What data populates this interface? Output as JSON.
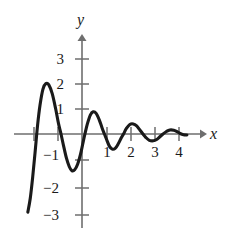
{
  "figure": {
    "title": "",
    "background_color": "#ffffff",
    "curve_color": "#1a1a1a",
    "axis_color": "#6e6e6e",
    "label_color": "#1a1a1a"
  },
  "axes": {
    "x_axis_label": "x",
    "y_axis_label": "y",
    "x_ticks": [
      {
        "value": -2,
        "label": ""
      },
      {
        "value": -1,
        "label": "−1"
      },
      {
        "value": 1,
        "label": "1"
      },
      {
        "value": 2,
        "label": "2"
      },
      {
        "value": 3,
        "label": "3"
      },
      {
        "value": 4,
        "label": "4"
      }
    ],
    "y_ticks": [
      {
        "value": 3,
        "label": "3"
      },
      {
        "value": 2,
        "label": "2"
      },
      {
        "value": 1,
        "label": "1"
      },
      {
        "value": -1,
        "label": "−1"
      },
      {
        "value": -2,
        "label": "−2"
      },
      {
        "value": -3,
        "label": "−3"
      }
    ],
    "x_arrow": "right",
    "y_arrow": "up"
  },
  "chart_data": {
    "type": "line",
    "title": "",
    "xlabel": "x",
    "ylabel": "y",
    "xlim": [
      -2.3,
      4.6
    ],
    "ylim": [
      -3.4,
      3.4
    ],
    "grid": false,
    "legend": "none",
    "x_ticks": [
      -2,
      -1,
      1,
      2,
      3,
      4
    ],
    "y_ticks": [
      -3,
      -2,
      -1,
      1,
      2,
      3
    ],
    "series": [
      {
        "name": "curve",
        "points": [
          [
            -2.22,
            -3.1
          ],
          [
            -2.12,
            -2.55
          ],
          [
            -2.02,
            -1.7
          ],
          [
            -1.92,
            -0.7
          ],
          [
            -1.82,
            0.35
          ],
          [
            -1.72,
            1.15
          ],
          [
            -1.6,
            1.78
          ],
          [
            -1.48,
            2.0
          ],
          [
            -1.36,
            1.95
          ],
          [
            -1.22,
            1.6
          ],
          [
            -1.08,
            1.0
          ],
          [
            -0.96,
            0.4
          ],
          [
            -0.86,
            0.0
          ],
          [
            -0.76,
            -0.45
          ],
          [
            -0.64,
            -0.95
          ],
          [
            -0.52,
            -1.3
          ],
          [
            -0.42,
            -1.45
          ],
          [
            -0.3,
            -1.42
          ],
          [
            -0.18,
            -1.2
          ],
          [
            -0.06,
            -0.8
          ],
          [
            0.04,
            -0.35
          ],
          [
            0.12,
            0.0
          ],
          [
            0.22,
            0.4
          ],
          [
            0.34,
            0.75
          ],
          [
            0.46,
            0.88
          ],
          [
            0.58,
            0.82
          ],
          [
            0.7,
            0.58
          ],
          [
            0.82,
            0.25
          ],
          [
            0.92,
            0.0
          ],
          [
            1.0,
            -0.2
          ],
          [
            1.12,
            -0.48
          ],
          [
            1.24,
            -0.6
          ],
          [
            1.36,
            -0.57
          ],
          [
            1.48,
            -0.4
          ],
          [
            1.6,
            -0.17
          ],
          [
            1.7,
            0.0
          ],
          [
            1.82,
            0.22
          ],
          [
            1.96,
            0.38
          ],
          [
            2.1,
            0.4
          ],
          [
            2.24,
            0.32
          ],
          [
            2.38,
            0.15
          ],
          [
            2.5,
            0.0
          ],
          [
            2.62,
            -0.14
          ],
          [
            2.76,
            -0.25
          ],
          [
            2.92,
            -0.27
          ],
          [
            3.06,
            -0.22
          ],
          [
            3.2,
            -0.1
          ],
          [
            3.32,
            0.0
          ],
          [
            3.46,
            0.1
          ],
          [
            3.6,
            0.16
          ],
          [
            3.76,
            0.15
          ],
          [
            3.9,
            0.09
          ],
          [
            4.02,
            0.02
          ],
          [
            4.16,
            -0.03
          ],
          [
            4.3,
            -0.04
          ]
        ]
      }
    ]
  }
}
